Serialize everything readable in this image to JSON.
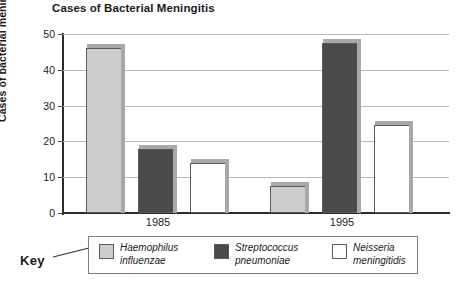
{
  "chart_data": {
    "type": "bar",
    "title": "Cases of Bacterial Meningitis",
    "xlabel": "",
    "ylabel": "Cases of bacterial meningitis (%)",
    "ylim": [
      0,
      50
    ],
    "yticks": [
      0,
      10,
      20,
      30,
      40,
      50
    ],
    "grid": true,
    "legend_position": "bottom",
    "legend_title": "Key",
    "categories": [
      "1985",
      "1995"
    ],
    "series": [
      {
        "name": "Haemophilus influenzae",
        "name_line1": "Haemophilus",
        "name_line2": "influenzae",
        "color": "#cdcdcd",
        "values": [
          46,
          7.5
        ]
      },
      {
        "name": "Streptococcus pneumoniae",
        "name_line1": "Streptococcus",
        "name_line2": "pneumoniae",
        "color": "#4a4a4a",
        "values": [
          18,
          47.5
        ]
      },
      {
        "name": "Neisseria meningitidis",
        "name_line1": "Neisseria",
        "name_line2": "meningitidis",
        "color": "#ffffff",
        "values": [
          14,
          24.5
        ]
      }
    ]
  },
  "axis": {
    "y_tick_labels": [
      "0",
      "10",
      "20",
      "30",
      "40",
      "50"
    ],
    "x_tick_labels": [
      "1985",
      "1995"
    ]
  }
}
